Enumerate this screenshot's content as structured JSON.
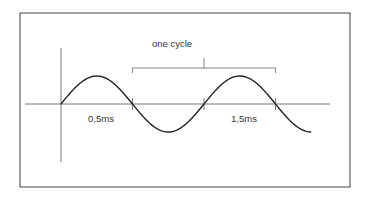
{
  "title_label": "one cycle",
  "tick_labels": [
    "0,5ms",
    "1,5ms"
  ],
  "colors": {
    "wave": "#222222",
    "axis": "#555555",
    "frame": "#444444",
    "bracket": "#666666"
  },
  "chart_data": {
    "type": "line",
    "title": "",
    "xlabel": "",
    "ylabel": "",
    "annotation": "one cycle",
    "annotation_span_ms": [
      0.5,
      1.5
    ],
    "function": "sine",
    "period_ms": 1.0,
    "amplitude": 1,
    "x_range_ms": [
      0,
      1.75
    ],
    "tick_positions_ms": [
      0.5,
      1.0,
      1.5
    ],
    "tick_labels": [
      {
        "x": 0.5,
        "text": "0,5ms"
      },
      {
        "x": 1.5,
        "text": "1,5ms"
      }
    ],
    "grid": false
  }
}
